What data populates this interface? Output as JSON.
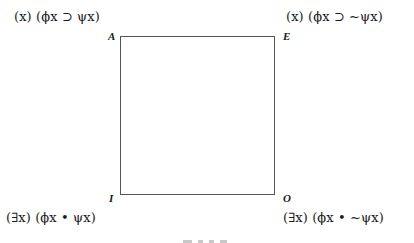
{
  "diagram": {
    "type": "square-of-opposition",
    "corners": {
      "A": {
        "label": "A",
        "formula": "(x) (ϕx ⊃ ψx)"
      },
      "E": {
        "label": "E",
        "formula": "(x) (ϕx ⊃ ~ψx)"
      },
      "I": {
        "label": "I",
        "formula": "(∃x) (ϕx • ψx)"
      },
      "O": {
        "label": "O",
        "formula": "(∃x) (ϕx • ~ψx)"
      }
    },
    "colors": {
      "line": "#555555",
      "text": "#1a1a1a",
      "background": "#ffffff"
    }
  }
}
